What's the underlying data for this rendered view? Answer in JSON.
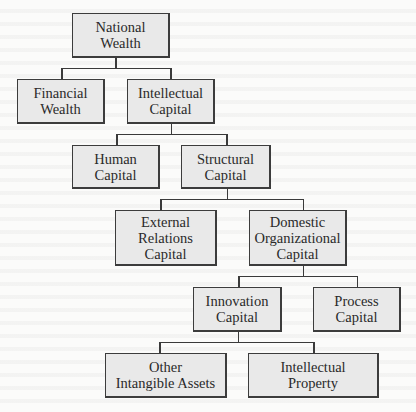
{
  "diagram": {
    "type": "hierarchy-tree",
    "nodes": {
      "national_wealth": "National\nWealth",
      "financial_wealth": "Financial\nWealth",
      "intellectual_capital": "Intellectual\nCapital",
      "human_capital": "Human\nCapital",
      "structural_capital": "Structural\nCapital",
      "external_relations_capital": "External\nRelations\nCapital",
      "domestic_organizational_capital": "Domestic\nOrganizational\nCapital",
      "innovation_capital": "Innovation\nCapital",
      "process_capital": "Process\nCapital",
      "other_intangible_assets": "Other\nIntangible Assets",
      "intellectual_property": "Intellectual\nProperty"
    },
    "edges": [
      [
        "national_wealth",
        "financial_wealth"
      ],
      [
        "national_wealth",
        "intellectual_capital"
      ],
      [
        "intellectual_capital",
        "human_capital"
      ],
      [
        "intellectual_capital",
        "structural_capital"
      ],
      [
        "structural_capital",
        "external_relations_capital"
      ],
      [
        "structural_capital",
        "domestic_organizational_capital"
      ],
      [
        "domestic_organizational_capital",
        "innovation_capital"
      ],
      [
        "domestic_organizational_capital",
        "process_capital"
      ],
      [
        "innovation_capital",
        "other_intangible_assets"
      ],
      [
        "innovation_capital",
        "intellectual_property"
      ]
    ],
    "colors": {
      "box_fill": "#e9e9e9",
      "box_border": "#3c3c3c",
      "connector": "#3a3a3a",
      "text": "#2a2a2a",
      "background": "#fbfbfa"
    }
  }
}
